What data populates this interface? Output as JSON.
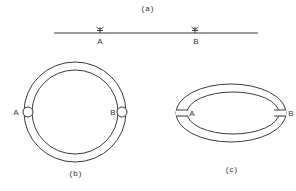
{
  "figure": {
    "panels": [
      {
        "id": "a",
        "caption": "(a)",
        "description": "Straight line with two junction markers",
        "points": [
          {
            "label": "A"
          },
          {
            "label": "B"
          }
        ]
      },
      {
        "id": "b",
        "caption": "(b)",
        "description": "Circular ring with two junctions",
        "points": [
          {
            "label": "A"
          },
          {
            "label": "B"
          }
        ]
      },
      {
        "id": "c",
        "caption": "(c)",
        "description": "Elliptical ring with two junctions",
        "points": [
          {
            "label": "A"
          },
          {
            "label": "B"
          }
        ]
      }
    ],
    "line_color": "#3a3a3a",
    "background": "#ffffff"
  }
}
